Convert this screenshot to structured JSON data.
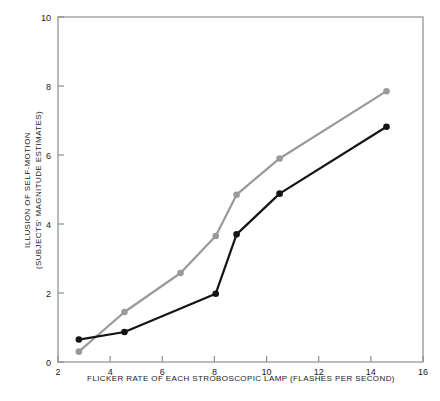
{
  "chart_data": {
    "type": "line",
    "title": "",
    "xlabel": "FLICKER RATE OF EACH STROBOSCOPIC LAMP (FLASHES PER SECOND)",
    "ylabel": "ILLUSION OF SELF-MOTION (SUBJECTS' MAGNITUDE ESTIMATES)",
    "ylabel_line1": "ILLUSION OF SELF-MOTION",
    "ylabel_line2": "(SUBJECTS' MAGNITUDE ESTIMATES)",
    "xlim": [
      2,
      16
    ],
    "ylim": [
      0,
      10
    ],
    "xticks": [
      2,
      4,
      6,
      8,
      10,
      12,
      14,
      16
    ],
    "yticks": [
      0,
      2,
      4,
      6,
      8,
      10
    ],
    "xtick_labels": [
      "2",
      "4",
      "6",
      "8",
      "10",
      "12",
      "14",
      "16"
    ],
    "ytick_labels": [
      "0",
      "2",
      "4",
      "6",
      "8",
      "10"
    ],
    "grid": false,
    "legend": "none",
    "series": [
      {
        "name": "upper-gray-series",
        "color": "#9a9a9a",
        "marker": "circle",
        "points": [
          {
            "x": 2.8,
            "y": 0.3
          },
          {
            "x": 4.55,
            "y": 1.45
          },
          {
            "x": 6.7,
            "y": 2.58
          },
          {
            "x": 8.05,
            "y": 3.65
          },
          {
            "x": 8.85,
            "y": 4.85
          },
          {
            "x": 10.5,
            "y": 5.9
          },
          {
            "x": 14.6,
            "y": 7.85
          }
        ]
      },
      {
        "name": "lower-black-series",
        "color": "#141414",
        "marker": "circle",
        "points": [
          {
            "x": 2.8,
            "y": 0.65
          },
          {
            "x": 4.55,
            "y": 0.87
          },
          {
            "x": 8.05,
            "y": 1.98
          },
          {
            "x": 8.85,
            "y": 3.7
          },
          {
            "x": 10.5,
            "y": 4.88
          },
          {
            "x": 14.6,
            "y": 6.82
          }
        ]
      }
    ]
  },
  "axes": {
    "frame_color": "#a8a8a8",
    "background": "#ffffff"
  }
}
